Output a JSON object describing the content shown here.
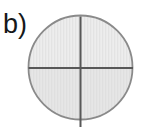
{
  "figure": {
    "panel_label": "b)",
    "label_color": "#16181a",
    "background_color": "#ffffff",
    "caption": "Circle divided into four quadrants by a vertical and a horizontal diameter"
  },
  "chart_data": {
    "type": "diagram",
    "title": "b)",
    "shape": "circle",
    "circle": {
      "center_x": 80.5,
      "center_y": 67.5,
      "radius": 52,
      "diameter": 104,
      "fill_color": "#e9e9e9",
      "stroke_color": "#8a8a8a",
      "stroke_width": 1.8,
      "texture": "fine vertical striation"
    },
    "divider_lines": [
      {
        "name": "horizontal-diameter",
        "orientation": "horizontal",
        "x1": 28.5,
        "y1": 68.0,
        "x2": 133.0,
        "y2": 68.0,
        "color": "#585858",
        "width": 2.0
      },
      {
        "name": "vertical-diameter",
        "orientation": "vertical",
        "x1": 80.5,
        "y1": 16.5,
        "x2": 80.5,
        "y2": 127.0,
        "color": "#585858",
        "width": 2.0,
        "note": "extends below the circle to the bottom edge of the canvas"
      }
    ],
    "quadrants": [
      {
        "name": "upper-left",
        "shaded": true
      },
      {
        "name": "upper-right",
        "shaded": true
      },
      {
        "name": "lower-left",
        "shaded": true
      },
      {
        "name": "lower-right",
        "shaded": true
      }
    ],
    "xlabel": "",
    "ylabel": "",
    "grid": false,
    "legend": "none"
  }
}
